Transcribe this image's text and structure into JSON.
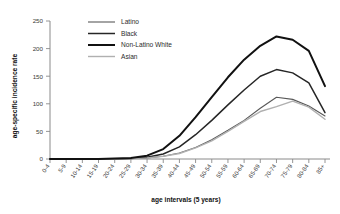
{
  "chart_data": {
    "type": "line",
    "title": "",
    "xlabel": "age intervals (5 years)",
    "ylabel": "age-specific incidence rate",
    "categories": [
      "0-4",
      "5-9",
      "10-14",
      "15-19",
      "20-24",
      "25-29",
      "30-34",
      "35-39",
      "40-44",
      "45-49",
      "50-54",
      "55-59",
      "60-64",
      "65-69",
      "70-74",
      "75-79",
      "80-84",
      "85+"
    ],
    "ylim": [
      0,
      250
    ],
    "yticks": [
      0,
      50,
      100,
      150,
      200,
      250
    ],
    "grid": false,
    "legend_position": "top-left-inside",
    "series": [
      {
        "name": "Latino",
        "color": "#595959",
        "width": 1.1,
        "values": [
          0,
          0,
          0,
          0,
          0,
          1,
          2,
          5,
          11,
          21,
          35,
          52,
          70,
          92,
          112,
          108,
          96,
          78
        ]
      },
      {
        "name": "Black",
        "color": "#262626",
        "width": 1.5,
        "values": [
          0,
          0,
          0,
          0,
          0,
          1,
          3,
          9,
          22,
          44,
          70,
          98,
          125,
          150,
          162,
          156,
          138,
          84
        ]
      },
      {
        "name": "Non-Latino White",
        "color": "#111111",
        "width": 2.0,
        "values": [
          0,
          0,
          0,
          0,
          1,
          2,
          6,
          18,
          42,
          76,
          112,
          148,
          180,
          205,
          222,
          216,
          196,
          132
        ]
      },
      {
        "name": "Asian",
        "color": "#b0b0b0",
        "width": 1.4,
        "values": [
          0,
          0,
          0,
          0,
          0,
          1,
          2,
          5,
          10,
          20,
          33,
          50,
          68,
          86,
          95,
          105,
          94,
          72
        ]
      }
    ]
  },
  "legend": {
    "items": [
      {
        "label": "Latino"
      },
      {
        "label": "Black"
      },
      {
        "label": "Non-Latino White"
      },
      {
        "label": "Asian"
      }
    ]
  },
  "axes": {
    "y_title": "age-specific incidence rate",
    "x_title": "age intervals (5 years)",
    "y_tick_labels": [
      "0",
      "50",
      "100",
      "150",
      "200",
      "250"
    ],
    "x_tick_labels": [
      "0-4",
      "5-9",
      "10-14",
      "15-19",
      "20-24",
      "25-29",
      "30-34",
      "35-39",
      "40-44",
      "45-49",
      "50-54",
      "55-59",
      "60-64",
      "65-69",
      "70-74",
      "75-79",
      "80-84",
      "85+"
    ]
  }
}
